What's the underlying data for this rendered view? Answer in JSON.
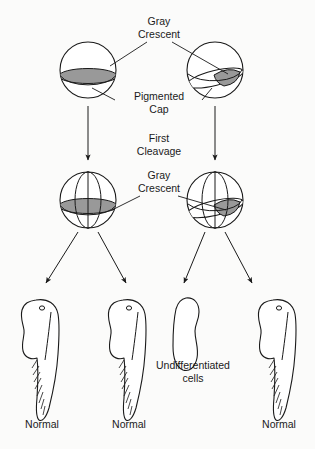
{
  "figure": {
    "background_color": "#fbfbfa",
    "line_color": "#1a1a1a",
    "gray_crescent_fill": "#999999"
  },
  "labels": {
    "gray_crescent_top_line1": "Gray",
    "gray_crescent_top_line2": "Crescent",
    "pigmented_cap_line1": "Pigmented",
    "pigmented_cap_line2": "Cap",
    "first_cleavage_line1": "First",
    "first_cleavage_line2": "Cleavage",
    "gray_crescent_mid_line1": "Gray",
    "gray_crescent_mid_line2": "Crescent",
    "undifferentiated_line1": "Undifferentiated",
    "undifferentiated_line2": "cells",
    "outcome_1": "Normal",
    "outcome_2": "Normal",
    "outcome_4": "Normal"
  },
  "rows": {
    "eggs": [
      {
        "name": "egg-left",
        "crescent_orientation": "equatorial-full"
      },
      {
        "name": "egg-right",
        "crescent_orientation": "oblique-right"
      }
    ],
    "zygotes": [
      {
        "name": "zygote-left",
        "cleavage": "vertical",
        "crescent_orientation": "equatorial-full"
      },
      {
        "name": "zygote-right",
        "cleavage": "vertical",
        "crescent_orientation": "oblique-right"
      }
    ],
    "outcomes": [
      {
        "name": "tadpole-1",
        "type": "tadpole",
        "label": "Normal"
      },
      {
        "name": "tadpole-2",
        "type": "tadpole",
        "label": "Normal"
      },
      {
        "name": "blob-3",
        "type": "undifferentiated",
        "label": "Undifferentiated cells"
      },
      {
        "name": "tadpole-4",
        "type": "tadpole",
        "label": "Normal"
      }
    ]
  }
}
